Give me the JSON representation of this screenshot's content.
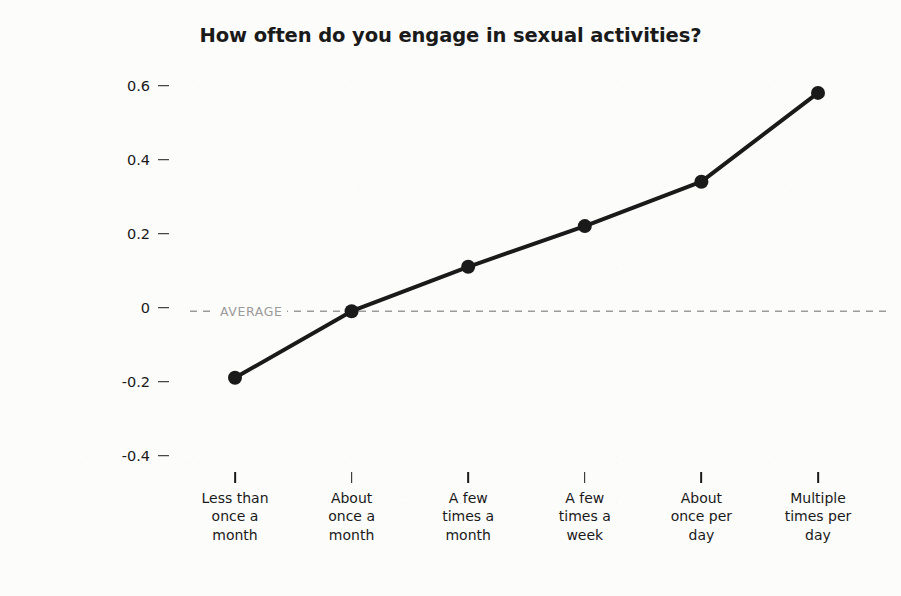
{
  "chart_data": {
    "type": "line",
    "title": "How often do you engage in sexual activities?",
    "xlabel": "",
    "ylabel": "Happiness Level",
    "categories": [
      "Less than once a month",
      "About once a month",
      "A few times a month",
      "A few times a week",
      "About once per day",
      "Multiple times per day"
    ],
    "category_lines": [
      [
        "Less than",
        "once a",
        "month"
      ],
      [
        "About",
        "once a",
        "month"
      ],
      [
        "A few",
        "times a",
        "month"
      ],
      [
        "A few",
        "times a",
        "week"
      ],
      [
        "About",
        "once per",
        "day"
      ],
      [
        "Multiple",
        "times per",
        "day"
      ]
    ],
    "values": [
      -0.19,
      -0.01,
      0.11,
      0.22,
      0.34,
      0.58
    ],
    "series": [
      {
        "name": "Happiness Level",
        "values": [
          -0.19,
          -0.01,
          0.11,
          0.22,
          0.34,
          0.58
        ]
      }
    ],
    "ylim": [
      -0.5,
      0.68
    ],
    "yticks": [
      0.6,
      0.4,
      0.2,
      0,
      -0.2,
      -0.4
    ],
    "ytick_labels": [
      "0.6",
      "0.4",
      "0.2",
      "0",
      "-0.2",
      "-0.4"
    ],
    "grid": false,
    "legend": null,
    "annotations": [
      {
        "name": "average-reference-line",
        "label": "AVERAGE",
        "y": -0.01,
        "style": "dashed",
        "color": "#9b9b9b"
      }
    ],
    "colors": {
      "line": "#1a1a1a",
      "marker": "#1a1a1a",
      "text": "#1a1a1a",
      "annotation": "#9b9b9b",
      "background": "#fcfcfb"
    },
    "marker": "circle",
    "line_width": 4
  }
}
